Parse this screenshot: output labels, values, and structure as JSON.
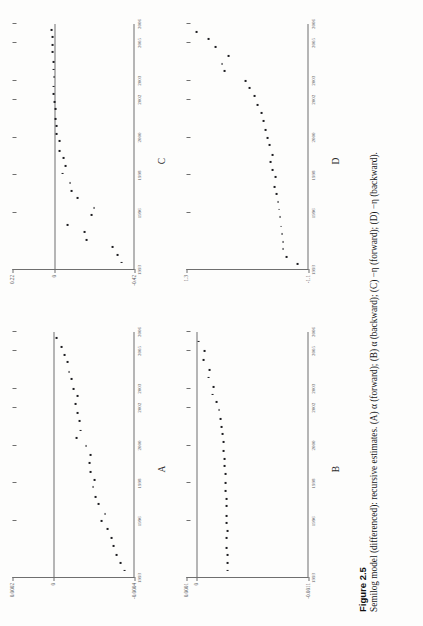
{
  "figure": {
    "number_label": "Figure 2.5",
    "caption": "Semilog model (differenced): recursive estimates. (A) α (forward); (B) α (backward); (C) −η (forward); (D) −η (backward)."
  },
  "chart_data": [
    {
      "id": "A",
      "type": "scatter",
      "title": "A",
      "panel_letter": "A",
      "xlabel": "",
      "ylabel": "",
      "xlim": [
        1993,
        2006
      ],
      "ylim": [
        -0.0004,
        0.0002
      ],
      "ytick_values": [
        0.0002,
        0,
        -0.0004
      ],
      "ytick_labels": [
        "0.0002",
        "0",
        "-0.0004"
      ],
      "xtick_values": [
        1993,
        1996,
        1998,
        2000,
        2002,
        2003,
        2005,
        2006
      ],
      "xtick_labels": [
        "1993",
        "1996",
        "1998",
        "2000",
        "2002",
        "2003",
        "2005",
        "2006"
      ],
      "zero_line": 0,
      "grid": false,
      "legend": "none",
      "x": [
        1993.4,
        1993.8,
        1994.2,
        1994.7,
        1995.1,
        1995.6,
        1996.0,
        1996.4,
        1996.9,
        1997.3,
        1997.8,
        1998.2,
        1998.6,
        1999.1,
        1999.5,
        2000.0,
        2000.4,
        2000.8,
        2001.3,
        2001.7,
        2002.2,
        2002.6,
        2003.0,
        2003.5,
        2003.9,
        2004.4,
        2004.8,
        2005.2,
        2005.7
      ],
      "y": [
        -0.000352,
        -0.00033,
        -0.000312,
        -0.000296,
        -0.000286,
        -0.000268,
        -0.00024,
        -0.000255,
        -0.000222,
        -0.00021,
        -0.000196,
        -0.000205,
        -0.000186,
        -0.000178,
        -0.000182,
        -0.000162,
        -0.000116,
        -0.000136,
        -0.000128,
        -0.000119,
        -0.000108,
        -0.00012,
        -0.0001,
        -9.2e-05,
        -7.8e-05,
        -7e-05,
        -5.8e-05,
        -4e-05,
        -1.6e-05
      ]
    },
    {
      "id": "B",
      "type": "scatter",
      "title": "B",
      "panel_letter": "B",
      "xlabel": "",
      "ylabel": "",
      "xlim": [
        1993,
        2006
      ],
      "ylim": [
        -0.0011,
        0.0001
      ],
      "ytick_values": [
        0.0001,
        0,
        -0.0011
      ],
      "ytick_labels": [
        "0.0001",
        "0",
        "-0.0011"
      ],
      "xtick_values": [
        1993,
        1996,
        1998,
        2000,
        2002,
        2003,
        2005,
        2006
      ],
      "xtick_labels": [
        "1993",
        "1996",
        "1998",
        "2000",
        "2002",
        "2003",
        "2005",
        "2006"
      ],
      "zero_line": 0,
      "grid": false,
      "legend": "none",
      "x": [
        1993.4,
        1993.8,
        1994.2,
        1994.6,
        1995.1,
        1995.5,
        1995.9,
        1996.3,
        1996.8,
        1997.2,
        1997.6,
        1998.0,
        1998.5,
        1998.9,
        1999.3,
        1999.7,
        2000.2,
        2000.6,
        2001.0,
        2001.4,
        2001.9,
        2002.3,
        2002.7,
        2003.1,
        2003.6,
        2004.0,
        2004.5,
        2005.0,
        2005.5
      ],
      "y": [
        -0.0003,
        -0.0003,
        -0.000302,
        -0.000298,
        -0.000296,
        -0.0003,
        -0.000298,
        -0.000294,
        -0.000292,
        -0.00029,
        -0.000286,
        -0.000284,
        -0.00028,
        -0.000276,
        -0.000272,
        -0.000268,
        -0.000262,
        -0.000258,
        -0.000248,
        -0.000236,
        -0.00022,
        -0.000196,
        -0.000156,
        -0.000162,
        -0.00012,
        -0.000128,
        -6.8e-05,
        -7.4e-05,
        -2e-05
      ]
    },
    {
      "id": "C",
      "type": "scatter",
      "title": "C",
      "panel_letter": "C",
      "xlabel": "",
      "ylabel": "",
      "xlim": [
        1993,
        2006
      ],
      "ylim": [
        -0.42,
        0.22
      ],
      "ytick_values": [
        0.22,
        0,
        -0.42
      ],
      "ytick_labels": [
        "0.22",
        "0",
        "-0.42"
      ],
      "xtick_values": [
        1993,
        1996,
        1998,
        2000,
        2002,
        2003,
        2005,
        2006
      ],
      "xtick_labels": [
        "1993",
        "1996",
        "1998",
        "2000",
        "2002",
        "2003",
        "2005",
        "2006"
      ],
      "zero_line": 0,
      "grid": false,
      "legend": "none",
      "x": [
        1993.4,
        1993.8,
        1994.2,
        1994.6,
        1995.0,
        1995.4,
        1995.9,
        1996.3,
        1996.8,
        1997.2,
        1997.6,
        1998.1,
        1998.5,
        1998.9,
        1999.3,
        1999.8,
        2000.2,
        2000.6,
        2001.0,
        2001.5,
        2001.9,
        2002.3,
        2002.7,
        2003.2,
        2003.6,
        2004.0,
        2004.5,
        2004.9,
        2005.3,
        2005.7
      ],
      "y": [
        -0.352,
        -0.33,
        -0.305,
        -0.17,
        -0.16,
        -0.07,
        -0.195,
        -0.208,
        -0.12,
        -0.09,
        -0.082,
        -0.042,
        -0.06,
        -0.05,
        -0.028,
        -0.028,
        -0.012,
        -0.01,
        -0.006,
        -0.004,
        -0.002,
        0.006,
        0.004,
        0.002,
        0.004,
        0.006,
        0.008,
        0.01,
        0.012,
        0.016
      ]
    },
    {
      "id": "D",
      "type": "scatter",
      "title": "D",
      "panel_letter": "D",
      "xlabel": "",
      "ylabel": "",
      "xlim": [
        1993,
        2006
      ],
      "ylim": [
        -1.1,
        1.3
      ],
      "ytick_values": [
        1.3,
        -1.1
      ],
      "ytick_labels": [
        "1.3",
        "-1.1"
      ],
      "xtick_values": [
        1993,
        1996,
        1998,
        2000,
        2002,
        2003,
        2005,
        2006
      ],
      "xtick_labels": [
        "1993",
        "1996",
        "1998",
        "2000",
        "2002",
        "2003",
        "2005",
        "2006"
      ],
      "zero_line": null,
      "grid": false,
      "legend": "none",
      "x": [
        1993.3,
        1993.7,
        1994.1,
        1994.5,
        1994.9,
        1995.3,
        1995.8,
        1996.2,
        1996.6,
        1997.0,
        1997.4,
        1997.9,
        1998.3,
        1998.7,
        1999.1,
        1999.6,
        2000.0,
        2000.4,
        2000.9,
        2001.3,
        2001.7,
        2002.2,
        2002.6,
        2003.0,
        2003.5,
        2003.9,
        2004.3,
        2004.8,
        2005.2,
        2005.6
      ],
      "y": [
        -0.88,
        -0.66,
        -0.6,
        -0.6,
        -0.58,
        -0.56,
        -0.54,
        -0.52,
        -0.5,
        -0.48,
        -0.44,
        -0.46,
        -0.4,
        -0.36,
        -0.4,
        -0.34,
        -0.3,
        -0.26,
        -0.22,
        -0.18,
        -0.1,
        -0.04,
        0.06,
        0.14,
        0.56,
        0.6,
        0.48,
        0.72,
        0.86,
        1.1
      ]
    }
  ]
}
